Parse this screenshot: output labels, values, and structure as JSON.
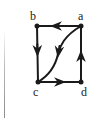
{
  "diagram": {
    "type": "directed-graph",
    "colors": {
      "stroke": "#1a1a1a",
      "label": "#222222",
      "background": "#ffffff"
    },
    "vertices": [
      {
        "id": "a",
        "label": "a",
        "x": 81,
        "y": 26,
        "label_x": 78,
        "label_y": 20
      },
      {
        "id": "b",
        "label": "b",
        "x": 37,
        "y": 26,
        "label_x": 30,
        "label_y": 20
      },
      {
        "id": "c",
        "label": "c",
        "x": 38,
        "y": 82,
        "label_x": 33,
        "label_y": 96
      },
      {
        "id": "d",
        "label": "d",
        "x": 81,
        "y": 82,
        "label_x": 81,
        "label_y": 96
      }
    ],
    "edges": [
      {
        "from": "a",
        "to": "b",
        "shape": "straight"
      },
      {
        "from": "b",
        "to": "c",
        "shape": "straight"
      },
      {
        "from": "c",
        "to": "d",
        "shape": "straight"
      },
      {
        "from": "d",
        "to": "a",
        "shape": "straight"
      },
      {
        "from": "a",
        "to": "c",
        "shape": "curved"
      }
    ]
  }
}
